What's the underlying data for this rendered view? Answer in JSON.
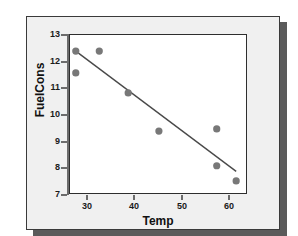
{
  "chart_data": {
    "type": "scatter",
    "title": "",
    "xlabel": "Temp",
    "ylabel": "FuelCons",
    "xlim": [
      25.2,
      64.6
    ],
    "ylim": [
      7,
      13
    ],
    "xticks": [
      30,
      40,
      50,
      60
    ],
    "yticks": [
      7,
      8,
      9,
      10,
      11,
      12,
      13
    ],
    "grid": false,
    "legend": null,
    "series": [
      {
        "name": "FuelCons vs Temp",
        "marker": "filled-circle",
        "color": "#787878",
        "points": [
          {
            "x": 26.7,
            "y": 12.36
          },
          {
            "x": 31.9,
            "y": 12.36
          },
          {
            "x": 26.7,
            "y": 11.54
          },
          {
            "x": 38.3,
            "y": 10.79
          },
          {
            "x": 45.1,
            "y": 9.36
          },
          {
            "x": 57.9,
            "y": 9.44
          },
          {
            "x": 57.9,
            "y": 8.06
          },
          {
            "x": 62.2,
            "y": 7.49
          }
        ]
      },
      {
        "name": "Fitted regression line",
        "type": "line",
        "color": "#4a4a4a",
        "endpoints": [
          {
            "x": 26.7,
            "y": 12.36
          },
          {
            "x": 62.2,
            "y": 7.85
          }
        ]
      }
    ]
  },
  "axes": {
    "y_tick_labels": [
      "13",
      "12",
      "11",
      "10",
      "9",
      "8",
      "7"
    ],
    "x_tick_labels": [
      "30",
      "40",
      "50",
      "60"
    ],
    "y_axis_title": "FuelCons",
    "x_axis_title": "Temp"
  },
  "colors": {
    "panel_background": "#f0f0f0",
    "plot_background": "#ffffff",
    "panel_border": "#3a3a3a",
    "plot_border": "#2e2e2e",
    "axis_line": "#6b6b6b",
    "marker": "#787878",
    "fit_line": "#4a4a4a",
    "shadow": "#5b5b5b",
    "page_background": "#ffffff",
    "tick_label": "#1a1a1a",
    "axis_title": "#111111"
  }
}
